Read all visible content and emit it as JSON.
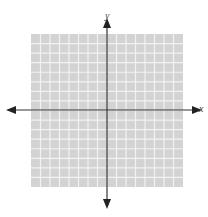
{
  "diagram": {
    "type": "coordinate-plane",
    "grid": {
      "columns": 16,
      "rows": 16,
      "fill": "#d3d3d3",
      "line_color": "#f2f2f2"
    },
    "axes": {
      "x_label": "x",
      "y_label": "y",
      "color": "#333333"
    },
    "top_text": "(partially visible text cut off at top edge)"
  }
}
